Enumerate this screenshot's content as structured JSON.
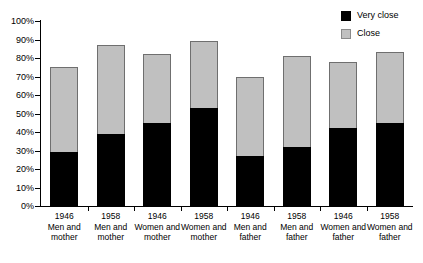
{
  "chart_data": {
    "type": "bar",
    "subtype": "stacked-vertical",
    "title": "",
    "xlabel": "",
    "ylabel": "",
    "ylim": [
      0,
      100
    ],
    "ytick_labels": [
      "0%",
      "10%",
      "20%",
      "30%",
      "40%",
      "50%",
      "60%",
      "70%",
      "80%",
      "90%",
      "100%"
    ],
    "ytick_values": [
      0,
      10,
      20,
      30,
      40,
      50,
      60,
      70,
      80,
      90,
      100
    ],
    "grid": false,
    "legend_position": "top-right",
    "categories": [
      "1946 Men and mother",
      "1958 Men and mother",
      "1946 Women and mother",
      "1958 Women and mother",
      "1946 Men and father",
      "1958 Men and father",
      "1946 Women and father",
      "1958 Women and father"
    ],
    "category_lines": [
      {
        "year": "1946",
        "group": "Men and mother"
      },
      {
        "year": "1958",
        "group": "Men and mother"
      },
      {
        "year": "1946",
        "group": "Women and mother"
      },
      {
        "year": "1958",
        "group": "Women and mother"
      },
      {
        "year": "1946",
        "group": "Men and father"
      },
      {
        "year": "1958",
        "group": "Men and father"
      },
      {
        "year": "1946",
        "group": "Women and father"
      },
      {
        "year": "1958",
        "group": "Women and father"
      }
    ],
    "series": [
      {
        "name": "Very close",
        "color": "#000000",
        "values": [
          29,
          39,
          45,
          53,
          27,
          32,
          42,
          45
        ]
      },
      {
        "name": "Close",
        "color": "#c0c0c0",
        "values": [
          46,
          48,
          37,
          36,
          43,
          49,
          36,
          38
        ]
      }
    ],
    "totals": [
      75,
      87,
      82,
      89,
      70,
      81,
      78,
      83
    ]
  },
  "legend": {
    "items": [
      {
        "label": "Very close",
        "swatch": "black-square-icon"
      },
      {
        "label": "Close",
        "swatch": "gray-square-icon"
      }
    ]
  },
  "colors": {
    "very_close": "#000000",
    "close": "#c0c0c0",
    "axis": "#000000",
    "background": "#ffffff"
  }
}
